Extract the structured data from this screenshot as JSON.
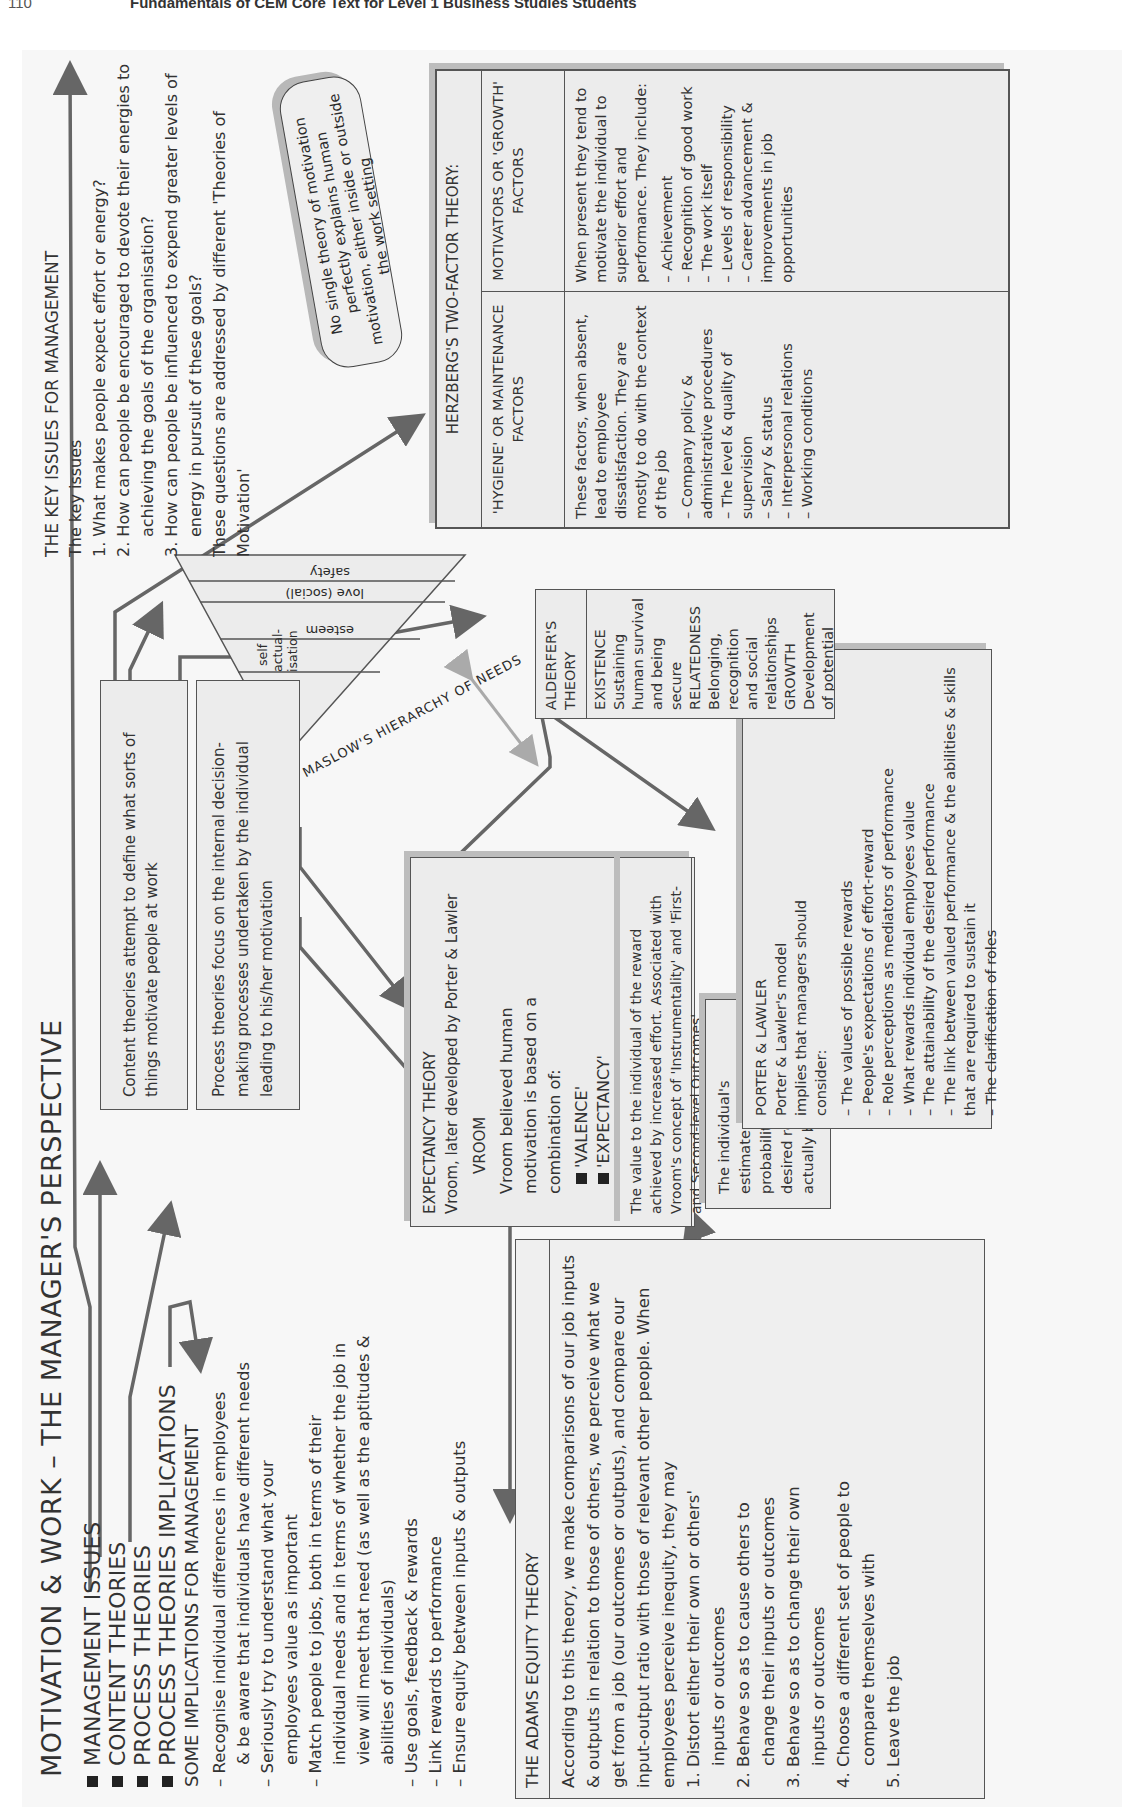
{
  "page_header": {
    "page_number": "110",
    "running_title": "Fundamentals of CEM Core Text for Level 1 Business Studies Students"
  },
  "title": "MOTIVATION & WORK – THE MANAGER'S PERSPECTIVE",
  "legend": [
    "MANAGEMENT ISSUES",
    "CONTENT THEORIES",
    "PROCESS THEORIES",
    "PROCESS THEORIES IMPLICATIONS"
  ],
  "implications": {
    "heading": "SOME IMPLICATIONS FOR MANAGEMENT",
    "items": [
      {
        "first": "– Recognise individual differences in employees",
        "rest": "& be aware that individuals have different needs"
      },
      {
        "first": "– Seriously try to understand what your",
        "rest": "employees value as important"
      },
      {
        "first": "– Match people to jobs, both in terms of their",
        "rest": "individual needs and in terms of whether the job in view will meet that need (as well as the aptitudes & abilities of individuals)"
      },
      {
        "first": "– Use goals, feedback & rewards",
        "rest": ""
      },
      {
        "first": "– Link rewards to performance",
        "rest": ""
      },
      {
        "first": "– Ensure equity between inputs & outputs",
        "rest": ""
      }
    ]
  },
  "adams": {
    "heading": "THE ADAMS EQUITY THEORY",
    "intro": "According to this theory, we make comparisons of our job inputs & outputs in relation to those of others, we perceive what we get from a job (our outcomes or outputs), and compare our input-output ratio with those of relevant other people. When employees perceive inequity, they may",
    "options": [
      {
        "n": "1. Distort either their own or others'",
        "rest": "inputs or outcomes"
      },
      {
        "n": "2. Behave so as to cause others to",
        "rest": "change their inputs or outcomes"
      },
      {
        "n": "3. Behave so as to change their own",
        "rest": "inputs or outcomes"
      },
      {
        "n": "4. Choose a different set of people to",
        "rest": "compare themselves with"
      },
      {
        "n": "5. Leave the job",
        "rest": ""
      }
    ]
  },
  "content_box": "Content theories attempt to define what sorts of things motivate people at work",
  "process_box": "Process theories focus on the internal decision-making processes undertaken by the individual leading to his/her motivation",
  "expectancy": {
    "heading": "EXPECTANCY THEORY",
    "subheading": "Vroom, later developed by Porter & Lawler",
    "vroom_label": "VROOM",
    "vroom_text": "Vroom believed human motivation is based on a combination of:",
    "valence": "'VALENCE'",
    "expectancy": "'EXPECTANCY'",
    "valence_desc": "The value to the individual of the reward achieved by increased effort. Associated with Vroom's concept of 'Instrumentality' and 'First- and Second-level Outcomes'",
    "expectancy_desc": "The individual's estimate of the probability that the desired reward will actually be achieved"
  },
  "porter_lawler": {
    "heading": "PORTER & LAWLER",
    "intro": "Porter & Lawler's model implies that managers should consider:",
    "items": [
      "– The values of possible rewards",
      "– People's expectations of effort-reward",
      "– Role perceptions as mediators of performance",
      "– What rewards individual employees value",
      "– The attainability of the desired performance",
      "– The link between valued performance & the abilities & skills that are required to sustain it",
      "– The clarification of roles"
    ]
  },
  "maslow": {
    "caption": "MASLOW'S HIERARCHY OF NEEDS",
    "levels": [
      "self actual- isation",
      "esteem",
      "love (social)",
      "safety",
      "survival (physiological)"
    ]
  },
  "alderfer": {
    "heading": "ALDERFER'S THEORY",
    "lines": [
      "EXISTENCE",
      "Sustaining human survival",
      "and being secure",
      "RELATEDNESS",
      "Belonging, recognition",
      "and social relationships",
      "GROWTH",
      "Development of potential"
    ]
  },
  "key_issues": {
    "heading": "THE KEY ISSUES FOR MANAGEMENT",
    "subheading": "The key issues",
    "items": [
      "1. What makes people expect effort or energy?",
      "2. How can people be encouraged to devote their energies to achieving the goals of the organisation?",
      "3. How can people be influenced to expend greater levels of energy in pursuit of these goals?"
    ],
    "closing": "These questions are addressed by different 'Theories of Motivation'"
  },
  "note": "No single theory of motivation perfectly explains human motivation, either inside or outside the work setting",
  "herzberg": {
    "heading": "HERZBERG'S TWO-FACTOR THEORY:",
    "columns": [
      {
        "title": "'HYGIENE' OR MAINTENANCE FACTORS",
        "desc": "These factors, when absent, lead to employee dissatisfaction. They are mostly to do with the context of the job",
        "items": [
          "– Company policy & administrative procedures",
          "– The level & quality of supervision",
          "– Salary & status",
          "– Interpersonal relations",
          "– Working conditions"
        ]
      },
      {
        "title": "MOTIVATORS OR 'GROWTH' FACTORS",
        "desc": "When present they tend to motivate the individual to superior effort and performance. They include:",
        "items": [
          "– Achievement",
          "– Recognition of good work",
          "– The work itself",
          "– Levels of responsibility",
          "– Career advancement & improvements in job opportunities"
        ]
      }
    ]
  },
  "colors": {
    "box_fill": "#ececec",
    "box_border": "#555555",
    "shadow": "#bdbdbd",
    "arrow": "#666666",
    "maslow_alderfer_link": "#aaaaaa"
  }
}
